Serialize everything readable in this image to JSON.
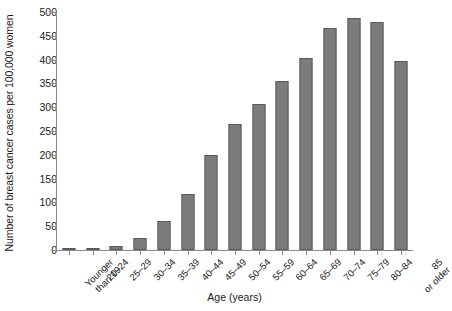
{
  "chart_data": {
    "type": "bar",
    "title": "",
    "xlabel": "Age (years)",
    "ylabel": "Number of breast cancer cases per 100,000 women",
    "categories": [
      "Younger than 19",
      "20–24",
      "25–29",
      "30–34",
      "35–39",
      "40–44",
      "45–49",
      "50–54",
      "55–59",
      "60–64",
      "65–69",
      "70–74",
      "75–79",
      "80–84",
      "85 or older"
    ],
    "category_lines": [
      [
        "Younger",
        "than 19"
      ],
      [
        "20–24"
      ],
      [
        "25–29"
      ],
      [
        "30–34"
      ],
      [
        "35–39"
      ],
      [
        "40–44"
      ],
      [
        "45–49"
      ],
      [
        "50–54"
      ],
      [
        "55–59"
      ],
      [
        "60–64"
      ],
      [
        "65–69"
      ],
      [
        "70–74"
      ],
      [
        "75–79"
      ],
      [
        "80–84"
      ],
      [
        "85",
        "or older"
      ]
    ],
    "values": [
      1,
      3,
      8,
      25,
      60,
      118,
      200,
      265,
      307,
      355,
      404,
      467,
      487,
      478,
      397
    ],
    "ylim": [
      0,
      500
    ],
    "yticks": [
      0,
      50,
      100,
      150,
      200,
      250,
      300,
      350,
      400,
      450,
      500
    ],
    "ytick_labels": [
      "0",
      "50",
      "100",
      "150",
      "200",
      "250",
      "300",
      "350",
      "400",
      "450",
      "500"
    ],
    "grid": false,
    "legend": null,
    "bar_color": "#7c7c7c",
    "bar_edge_color": "#5a5a5a",
    "axis_color": "#8a8a8a",
    "text_color": "#1a1a1a"
  }
}
